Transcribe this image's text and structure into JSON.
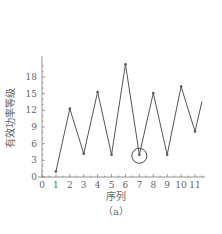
{
  "chart_data": {
    "type": "line",
    "title": "",
    "caption": "（a）",
    "xlabel": "序列",
    "ylabel": "有效功率等级",
    "x": [
      1,
      2,
      3,
      4,
      5,
      6,
      7,
      8,
      9,
      10,
      11,
      11.5
    ],
    "values": [
      1,
      12.3,
      4.2,
      15.3,
      4,
      20.3,
      4,
      15.1,
      4,
      16.3,
      8.2,
      13.6
    ],
    "xlim": [
      0,
      11.5
    ],
    "ylim": [
      0,
      21
    ],
    "xticks": [
      0,
      1,
      2,
      3,
      4,
      5,
      6,
      7,
      8,
      9,
      10,
      11
    ],
    "yticks": [
      0,
      3,
      6,
      9,
      12,
      15,
      18
    ],
    "grid": false,
    "legend": null,
    "annotations": [
      {
        "type": "circle",
        "x": 7,
        "y": 4,
        "note": "highlighted point"
      }
    ],
    "line_color": "#555555"
  }
}
